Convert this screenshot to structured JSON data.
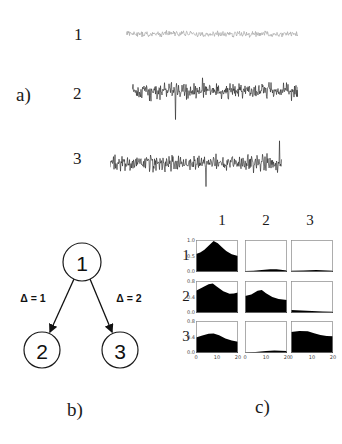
{
  "figure": {
    "panel_a": {
      "label": "a)",
      "trace_labels": [
        "1",
        "2",
        "3"
      ]
    },
    "panel_b": {
      "label": "b)",
      "node_labels": [
        "1",
        "2",
        "3"
      ],
      "edge_labels": [
        "Δ = 1",
        "Δ = 2"
      ]
    },
    "panel_c": {
      "label": "c)",
      "col_headers": [
        "1",
        "2",
        "3"
      ],
      "row_labels": [
        "1",
        "2",
        "3"
      ]
    }
  },
  "colors": {
    "trace_light": "#9e9e9e",
    "trace_dark": "#1c1c1c",
    "fill_black": "#000000",
    "frame_gray": "#8a8a8a",
    "ink": "#1a1a1a"
  },
  "chart_data": [
    {
      "type": "line",
      "panel": "a",
      "title": "",
      "description": "Three unlabeled noise-like time-series traces; trace 1 low-amplitude light gray, traces 2 and 3 high-amplitude dark with spikes",
      "series": [
        {
          "name": "1",
          "kind": "noise",
          "amplitude_px": 4.5,
          "spike_prob": 0.012,
          "spike_scale": 1.6,
          "color": "#9e9e9e",
          "seed": 101
        },
        {
          "name": "2",
          "kind": "noise",
          "amplitude_px": 11,
          "spike_prob": 0.035,
          "spike_scale": 2.6,
          "color": "#1c1c1c",
          "seed": 202
        },
        {
          "name": "3",
          "kind": "noise",
          "amplitude_px": 11,
          "spike_prob": 0.035,
          "spike_scale": 2.6,
          "color": "#1c1c1c",
          "seed": 303
        }
      ],
      "xlabel": "",
      "ylabel": ""
    },
    {
      "type": "area",
      "panel": "c",
      "title": "",
      "description": "3x3 grid of small black filled distribution plots; rows 1-3 vs columns 1-3; x axis 0-20 on bottom row; y tick labels on left column",
      "x_range": [
        0,
        20
      ],
      "cells": [
        {
          "row": "1",
          "col": "1",
          "yticks": [
            "1.0",
            "0.5",
            "0.0"
          ],
          "xticks": null,
          "profile": [
            [
              0,
              0.58
            ],
            [
              0.1,
              0.63
            ],
            [
              0.2,
              0.72
            ],
            [
              0.3,
              0.85
            ],
            [
              0.42,
              1.0
            ],
            [
              0.52,
              0.93
            ],
            [
              0.62,
              0.8
            ],
            [
              0.72,
              0.68
            ],
            [
              0.85,
              0.57
            ],
            [
              1,
              0.52
            ]
          ]
        },
        {
          "row": "1",
          "col": "2",
          "yticks": null,
          "xticks": null,
          "profile": [
            [
              0,
              0.03
            ],
            [
              0.2,
              0.04
            ],
            [
              0.4,
              0.06
            ],
            [
              0.6,
              0.09
            ],
            [
              0.75,
              0.09
            ],
            [
              0.9,
              0.06
            ],
            [
              1,
              0.05
            ]
          ]
        },
        {
          "row": "1",
          "col": "3",
          "yticks": null,
          "xticks": null,
          "profile": [
            [
              0,
              0.04
            ],
            [
              0.3,
              0.05
            ],
            [
              0.6,
              0.06
            ],
            [
              1,
              0.04
            ]
          ]
        },
        {
          "row": "2",
          "col": "1",
          "yticks": [
            "0.8",
            "0.4",
            "0.0"
          ],
          "xticks": null,
          "profile": [
            [
              0,
              0.72
            ],
            [
              0.15,
              0.82
            ],
            [
              0.3,
              0.93
            ],
            [
              0.4,
              0.95
            ],
            [
              0.5,
              0.85
            ],
            [
              0.65,
              0.7
            ],
            [
              0.8,
              0.62
            ],
            [
              0.9,
              0.63
            ],
            [
              1,
              0.66
            ]
          ]
        },
        {
          "row": "2",
          "col": "2",
          "yticks": null,
          "xticks": null,
          "profile": [
            [
              0,
              0.55
            ],
            [
              0.15,
              0.6
            ],
            [
              0.3,
              0.72
            ],
            [
              0.4,
              0.74
            ],
            [
              0.5,
              0.64
            ],
            [
              0.65,
              0.52
            ],
            [
              0.8,
              0.45
            ],
            [
              1,
              0.42
            ]
          ]
        },
        {
          "row": "2",
          "col": "3",
          "yticks": null,
          "xticks": null,
          "profile": [
            [
              0,
              0.1
            ],
            [
              0.25,
              0.08
            ],
            [
              0.5,
              0.06
            ],
            [
              0.75,
              0.05
            ],
            [
              1,
              0.04
            ]
          ]
        },
        {
          "row": "3",
          "col": "1",
          "yticks": [
            "0.8",
            "0.4",
            "0.0"
          ],
          "xticks": [
            "0",
            "10",
            "20"
          ],
          "profile": [
            [
              0,
              0.5
            ],
            [
              0.15,
              0.56
            ],
            [
              0.3,
              0.62
            ],
            [
              0.42,
              0.63
            ],
            [
              0.55,
              0.57
            ],
            [
              0.7,
              0.47
            ],
            [
              0.85,
              0.4
            ],
            [
              1,
              0.36
            ]
          ]
        },
        {
          "row": "3",
          "col": "2",
          "yticks": null,
          "xticks": [
            "0",
            "10",
            "20"
          ],
          "profile": [
            [
              0,
              0.02
            ],
            [
              0.25,
              0.03
            ],
            [
              0.5,
              0.06
            ],
            [
              0.7,
              0.08
            ],
            [
              0.85,
              0.07
            ],
            [
              1,
              0.06
            ]
          ]
        },
        {
          "row": "3",
          "col": "3",
          "yticks": null,
          "xticks": [
            "0",
            "10",
            "20"
          ],
          "profile": [
            [
              0,
              0.68
            ],
            [
              0.2,
              0.71
            ],
            [
              0.4,
              0.7
            ],
            [
              0.55,
              0.64
            ],
            [
              0.7,
              0.58
            ],
            [
              0.85,
              0.55
            ],
            [
              1,
              0.54
            ]
          ]
        }
      ]
    },
    {
      "type": "table",
      "panel": "b",
      "title": "",
      "description": "Directed graph: node 1 points to node 2 (delta=1) and node 3 (delta=2)",
      "nodes": [
        "1",
        "2",
        "3"
      ],
      "edges": [
        {
          "from": "1",
          "to": "2",
          "label": "Δ = 1"
        },
        {
          "from": "1",
          "to": "3",
          "label": "Δ = 2"
        }
      ]
    }
  ]
}
